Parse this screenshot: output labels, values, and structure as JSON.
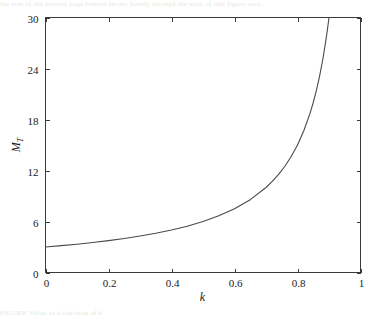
{
  "figure": {
    "background_color": "#ffffff",
    "axis_color": "#3b3b3b",
    "curve_color": "#4a4a4a",
    "ghost_top_text": "the text of the printed page behind shows faintly through the scan of this figure area",
    "ghost_bottom_text": "FIGURE  Value  as a function of k"
  },
  "chart_data": {
    "type": "line",
    "title": "",
    "xlabel": "k",
    "ylabel": "M_T",
    "ylabel_base": "M",
    "ylabel_sub": "T",
    "xlim": [
      0,
      1
    ],
    "ylim": [
      0,
      30
    ],
    "xticks": [
      0,
      0.2,
      0.4,
      0.6,
      0.8,
      1
    ],
    "xticklabels": [
      "0",
      "0.2",
      "0.4",
      "0.6",
      "0.8",
      "1"
    ],
    "yticks": [
      0,
      6,
      12,
      18,
      24,
      30
    ],
    "yticklabels": [
      "0",
      "6",
      "12",
      "18",
      "24",
      "30"
    ],
    "grid": false,
    "legend": null,
    "series": [
      {
        "name": "M_T(k)",
        "relation": "M_T = 3 / (1 - k)",
        "x": [
          0.0,
          0.05,
          0.1,
          0.15,
          0.2,
          0.25,
          0.3,
          0.35,
          0.4,
          0.45,
          0.5,
          0.55,
          0.6,
          0.65,
          0.7,
          0.72,
          0.74,
          0.76,
          0.78,
          0.8,
          0.82,
          0.84,
          0.85,
          0.86,
          0.87,
          0.88,
          0.89,
          0.895,
          0.9
        ],
        "y": [
          3.0,
          3.16,
          3.33,
          3.53,
          3.75,
          4.0,
          4.29,
          4.62,
          5.0,
          5.45,
          6.0,
          6.67,
          7.5,
          8.57,
          10.0,
          10.71,
          11.54,
          12.5,
          13.64,
          15.0,
          16.67,
          18.75,
          20.0,
          21.43,
          23.08,
          25.0,
          27.27,
          28.57,
          30.0
        ]
      }
    ]
  }
}
